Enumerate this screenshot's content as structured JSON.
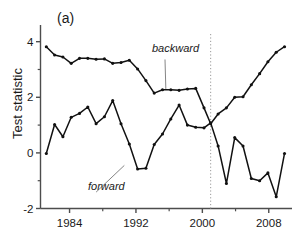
{
  "figure": {
    "panel_label": "(a)",
    "ylabel": "Test statistic",
    "background": "#ffffff",
    "line_color": "#111111",
    "marker_color": "#111111",
    "reference_line_color": "#999999"
  },
  "annotations": {
    "backward": "backward",
    "forward": "forward"
  },
  "axes": {
    "x_ticks": [
      "1984",
      "1992",
      "2000",
      "2008"
    ],
    "y_ticks": [
      "4",
      "2",
      "0",
      "-2"
    ]
  },
  "chart_data": {
    "type": "line",
    "title": "(a)",
    "xlabel": "",
    "ylabel": "Test statistic",
    "xlim": [
      1980.5,
      2010.8
    ],
    "ylim": [
      -2,
      4.6
    ],
    "x_ticks": [
      1984,
      1992,
      2000,
      2008
    ],
    "x_minor_ticks": [
      1988,
      1996,
      2004
    ],
    "y_ticks": [
      4,
      2,
      0,
      -2
    ],
    "y_minor_ticks": [
      3,
      1,
      -1
    ],
    "grid": false,
    "legend": "inline-annotations",
    "annotations": [
      {
        "text": "backward",
        "x": 1995.5,
        "y": 3.45,
        "style": "italic",
        "leader_to": {
          "x": 1995.6,
          "y": 2.3
        }
      },
      {
        "text": "forward",
        "x": 1987.2,
        "y": -1.32,
        "style": "italic",
        "leader_to": {
          "x": 1990.6,
          "y": -0.45
        }
      }
    ],
    "reference_lines": [
      {
        "type": "vertical",
        "x": 2001.0,
        "style": "dotted",
        "color": "#999999"
      }
    ],
    "series": [
      {
        "name": "backward",
        "marker": "filled-circle",
        "x": [
          1981.2,
          1982.2,
          1983.2,
          1984.2,
          1985.2,
          1986.2,
          1987.2,
          1988.2,
          1989.2,
          1990.2,
          1991.2,
          1992.2,
          1993.2,
          1994.2,
          1995.2,
          1996.2,
          1997.2,
          1998.2,
          1999.2,
          2000.2,
          2001.0,
          2001.9,
          2002.9,
          2003.9,
          2004.9,
          2005.9,
          2006.9,
          2007.9,
          2008.9,
          2009.9
        ],
        "values": [
          3.82,
          3.52,
          3.45,
          3.22,
          3.4,
          3.4,
          3.37,
          3.38,
          3.22,
          3.25,
          3.33,
          3.02,
          2.6,
          2.15,
          2.27,
          2.27,
          2.25,
          2.3,
          2.32,
          1.62,
          1.05,
          1.4,
          1.62,
          2.0,
          2.02,
          2.45,
          2.85,
          3.28,
          3.62,
          3.82
        ]
      },
      {
        "name": "forward",
        "marker": "filled-circle",
        "x": [
          1981.2,
          1982.2,
          1983.2,
          1984.2,
          1985.2,
          1986.2,
          1987.2,
          1988.2,
          1989.2,
          1990.2,
          1991.2,
          1992.2,
          1993.2,
          1994.2,
          1995.2,
          1996.2,
          1997.2,
          1998.2,
          1999.2,
          2000.2,
          2001.0,
          2001.9,
          2002.9,
          2003.9,
          2004.9,
          2005.9,
          2006.9,
          2007.9,
          2008.9,
          2009.9
        ],
        "values": [
          -0.02,
          1.02,
          0.58,
          1.28,
          1.42,
          1.65,
          1.05,
          1.3,
          1.88,
          1.05,
          0.32,
          -0.58,
          -0.55,
          0.3,
          0.68,
          1.22,
          1.72,
          1.0,
          0.92,
          0.9,
          1.08,
          0.25,
          -1.1,
          0.55,
          0.25,
          -0.92,
          -1.0,
          -0.72,
          -1.58,
          -0.02
        ]
      }
    ]
  }
}
